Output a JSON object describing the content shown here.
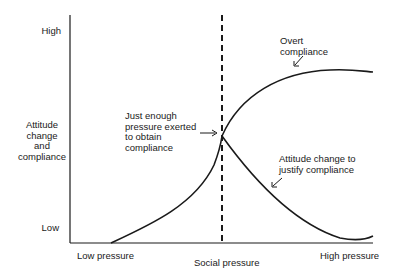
{
  "diagram": {
    "y_axis": {
      "title_lines": [
        "Attitude",
        "change",
        "and",
        "compliance"
      ],
      "high_label": "High",
      "low_label": "Low"
    },
    "x_axis": {
      "title": "Social pressure",
      "low_label": "Low pressure",
      "high_label": "High pressure"
    },
    "annotations": {
      "threshold_lines": [
        "Just enough",
        "pressure exerted",
        "to obtain",
        "compliance"
      ],
      "overt_lines": [
        "Overt",
        "compliance"
      ],
      "attitude_lines": [
        "Attitude change to",
        "justify compliance"
      ]
    },
    "curves": [
      {
        "name": "Overt compliance",
        "shape": "rises from low pressure, levels off near high"
      },
      {
        "name": "Attitude change to justify compliance",
        "shape": "rises to threshold then declines toward low"
      }
    ],
    "threshold_marker": "dashed vertical line at just-enough pressure",
    "colors": {
      "ink": "#1a1a1a",
      "background": "#ffffff"
    }
  }
}
